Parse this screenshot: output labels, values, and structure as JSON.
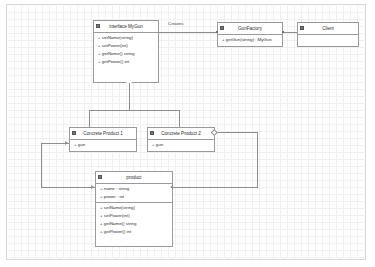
{
  "diagram": {
    "kind": "uml-class-diagram",
    "background": "#ffffff",
    "grid_color": "#e6e6ea",
    "line_color": "#8d8d8d",
    "border_color": "#9a9a9a"
  },
  "nodes": {
    "interface_mygun": {
      "title": "interface   MyGun",
      "icon": "class-icon",
      "operations": [
        "+ setName(string)",
        "+ setPower(int)",
        "+ getName() string",
        "+ getPower() int"
      ]
    },
    "gun_factory": {
      "title": "GunFactory",
      "icon": "class-icon",
      "operations": [
        "+ getGun(string) : MyGun"
      ]
    },
    "client": {
      "title": "Client",
      "icon": "class-icon",
      "operations": []
    },
    "concrete_product_1": {
      "title": "Concrete Product 1",
      "icon": "class-icon",
      "attributes": [
        "+ gun"
      ]
    },
    "concrete_product_2": {
      "title": "Concrete Product 2",
      "icon": "class-icon",
      "attributes": [
        "+ gun"
      ]
    },
    "product": {
      "title": "product",
      "icon": "class-icon",
      "attributes": [
        "+ name :  string",
        "+ power :  int"
      ],
      "operations": [
        "+ setName(string)",
        "+ setPower(int)",
        "+ getName() string",
        "+ getPower() int"
      ]
    }
  },
  "edges": {
    "creates_label": "Creates"
  }
}
